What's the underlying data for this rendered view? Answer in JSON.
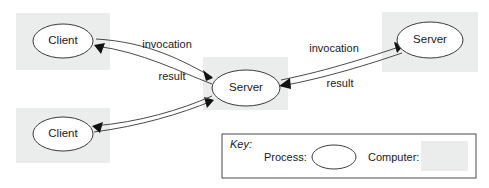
{
  "diagram": {
    "colors": {
      "computer_fill": "#ebecec",
      "process_fill": "#ffffff",
      "process_stroke": "#3a3a3a",
      "edge_stroke": "#4a4a4a",
      "arrowhead_fill": "#111111",
      "text": "#1a1a1a",
      "background": "#ffffff"
    },
    "nodes": [
      {
        "id": "client-top-left",
        "label": "Client",
        "type": "process",
        "on_computer": true,
        "cx": 63,
        "cy": 41,
        "rx": 30,
        "ry": 17
      },
      {
        "id": "client-bottom-left",
        "label": "Client",
        "type": "process",
        "on_computer": true,
        "cx": 63,
        "cy": 134,
        "rx": 30,
        "ry": 17
      },
      {
        "id": "server-center",
        "label": "Server",
        "type": "process",
        "on_computer": true,
        "cx": 246,
        "cy": 88,
        "rx": 34,
        "ry": 18
      },
      {
        "id": "server-top-right",
        "label": "Server",
        "type": "process",
        "on_computer": true,
        "cx": 430,
        "cy": 40,
        "rx": 33,
        "ry": 18
      }
    ],
    "computers": [
      {
        "id": "computer-top-left",
        "x": 16,
        "y": 13,
        "width": 94,
        "height": 57
      },
      {
        "id": "computer-bottom-left",
        "x": 16,
        "y": 108,
        "width": 94,
        "height": 55
      },
      {
        "id": "computer-center",
        "x": 203,
        "y": 57,
        "width": 85,
        "height": 53
      },
      {
        "id": "computer-top-right",
        "x": 382,
        "y": 12,
        "width": 96,
        "height": 60
      }
    ],
    "edges": [
      {
        "id": "edge-invocation-client-to-server",
        "label": "invocation",
        "from": "client-top-left",
        "to": "server-center",
        "label_x": 167,
        "label_y": 45
      },
      {
        "id": "edge-result-server-to-client",
        "label": "result",
        "from": "server-center",
        "to": "client-top-left",
        "label_x": 172,
        "label_y": 77
      },
      {
        "id": "edge-invocation-server-to-server",
        "label": "invocation",
        "from": "server-center",
        "to": "server-top-right",
        "label_x": 334,
        "label_y": 49
      },
      {
        "id": "edge-result-server-to-server",
        "label": "result",
        "from": "server-top-right",
        "to": "server-center",
        "label_x": 340,
        "label_y": 84
      },
      {
        "id": "edge-invocation-client2-to-server",
        "label": "",
        "from": "client-bottom-left",
        "to": "server-center",
        "label_x": 0,
        "label_y": 0
      },
      {
        "id": "edge-result-server-to-client2",
        "label": "",
        "from": "server-center",
        "to": "client-bottom-left",
        "label_x": 0,
        "label_y": 0
      }
    ],
    "key": {
      "title": "Key:",
      "process_label": "Process:",
      "computer_label": "Computer:",
      "box": {
        "x": 222,
        "y": 134,
        "width": 254,
        "height": 44
      }
    }
  }
}
